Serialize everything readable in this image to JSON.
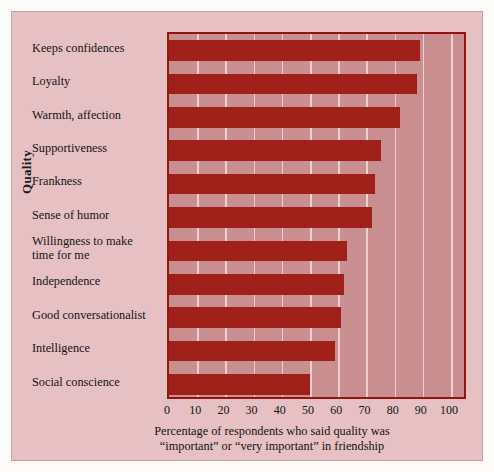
{
  "chart_data": {
    "type": "bar",
    "orientation": "horizontal",
    "title": "",
    "xlabel": "Percentage of respondents who said quality was “important” or “very important” in friendship",
    "xlabel_line1": "Percentage of respondents who said quality was",
    "xlabel_line2": "“important” or “very important” in friendship",
    "ylabel": "Quality",
    "categories": [
      "Keeps confidences",
      "Loyalty",
      "Warmth, affection",
      "Supportiveness",
      "Frankness",
      "Sense of humor",
      "Willingness to make\ntime for me",
      "Independence",
      "Good conversationalist",
      "Intelligence",
      "Social conscience"
    ],
    "values": [
      89,
      88,
      82,
      75,
      73,
      72,
      63,
      62,
      61,
      59,
      50
    ],
    "xlim": [
      0,
      106
    ],
    "xticks": [
      0,
      10,
      20,
      30,
      40,
      50,
      60,
      70,
      80,
      90,
      100
    ],
    "xticklabels": [
      "0",
      "10",
      "20",
      "30",
      "40",
      "50",
      "60",
      "70",
      "80",
      "90",
      "100"
    ],
    "grid": true,
    "grid_axis": "x",
    "legend": null,
    "colors": {
      "bar": "#9e2018",
      "plot_background": "#c98e90",
      "figure_background": "#e7c0c3",
      "gridline": "#edcfd0",
      "axis_frame": "#93150f",
      "text": "#141414"
    }
  }
}
